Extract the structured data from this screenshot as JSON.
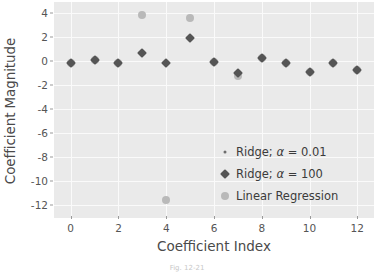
{
  "chart_data": {
    "type": "scatter",
    "title": "",
    "xlabel": "Coefficient Index",
    "ylabel": "Coefficient Magnitude",
    "xlim": [
      -0.7,
      12.7
    ],
    "ylim": [
      -13.1,
      4.9
    ],
    "xticks": [
      "0",
      "2",
      "4",
      "6",
      "8",
      "10",
      "12"
    ],
    "xtick_values": [
      0,
      2,
      4,
      6,
      8,
      10,
      12
    ],
    "yticks": [
      "4",
      "2",
      "0",
      "-2",
      "-4",
      "-6",
      "-8",
      "-10",
      "-12"
    ],
    "ytick_values": [
      4,
      2,
      0,
      -2,
      -4,
      -6,
      -8,
      -10,
      -12
    ],
    "grid": true,
    "legend_position": "lower right",
    "x": [
      0,
      1,
      2,
      3,
      4,
      5,
      6,
      7,
      8,
      9,
      10,
      11,
      12
    ],
    "series": [
      {
        "name": "Ridge; α = 0.01",
        "marker": "dot",
        "color": "#6d6d6d",
        "size": 3,
        "values": [
          -0.15,
          0.05,
          -0.15,
          0.75,
          -0.2,
          1.95,
          -0.1,
          -1.0,
          0.2,
          -0.15,
          -0.9,
          -0.15,
          -0.8
        ]
      },
      {
        "name": "Ridge; α = 100",
        "marker": "diamond",
        "color": "#555555",
        "size": 7,
        "values": [
          -0.15,
          0.05,
          -0.15,
          0.65,
          -0.2,
          1.9,
          -0.1,
          -1.05,
          0.2,
          -0.15,
          -0.9,
          -0.15,
          -0.8
        ]
      },
      {
        "name": "Linear Regression",
        "marker": "circle",
        "color": "#b9b9b9",
        "size": 8,
        "values": [
          -0.15,
          0.05,
          -0.15,
          3.85,
          -11.6,
          3.6,
          -0.1,
          -1.25,
          0.2,
          -0.15,
          -0.9,
          -0.15,
          -0.8
        ]
      }
    ]
  },
  "legend": {
    "items": [
      {
        "label_prefix": "Ridge; ",
        "alpha": "α",
        "label_suffix": " = 0.01",
        "full": "Ridge; α = 0.01"
      },
      {
        "label_prefix": "Ridge; ",
        "alpha": "α",
        "label_suffix": " = 100",
        "full": "Ridge; α = 100"
      },
      {
        "label_prefix": "",
        "alpha": "",
        "label_suffix": "",
        "full": "Linear Regression"
      }
    ]
  },
  "caption": "Fig. 12-21",
  "colors": {
    "plot_background": "#eaeaea",
    "gridline": "#fafafa",
    "ridge_small": "#6d6d6d",
    "ridge_large": "#555555",
    "linear_regression": "#b9b9b9",
    "text": "#3b3b3b"
  }
}
